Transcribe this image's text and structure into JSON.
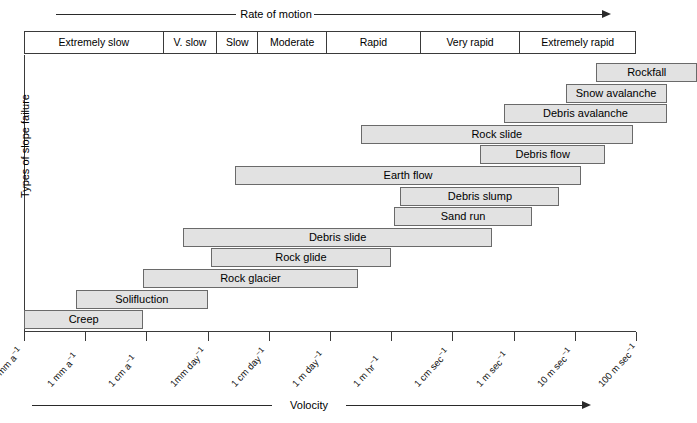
{
  "top_axis": {
    "label": "Rate of motion",
    "direction": "right"
  },
  "bottom_axis": {
    "label": "Volocity",
    "direction": "right"
  },
  "y_axis": {
    "label": "Types of slope failure"
  },
  "rate_classes": [
    {
      "label": "Extremely slow"
    },
    {
      "label": "V. slow"
    },
    {
      "label": "Slow"
    },
    {
      "label": "Moderate"
    },
    {
      "label": "Rapid"
    },
    {
      "label": "Very rapid"
    },
    {
      "label": "Extremely rapid"
    }
  ],
  "x_tick_labels": [
    "0.1 mm a",
    "1 mm a",
    "1 cm a",
    "1mm day",
    "1 cm day",
    "1 m day",
    "1 m hr",
    "1 cm sec",
    "1 m sec",
    "10 m sec",
    "100 m sec"
  ],
  "x_tick_exponent": "−1",
  "chart_data": {
    "type": "bar",
    "title": "",
    "subtitle": "",
    "xlabel": "Volocity",
    "ylabel": "Types of slope failure",
    "orientation": "horizontal-range",
    "grid": false,
    "legend": "none",
    "top_band_label": "Rate of motion",
    "x_axis_scale": "logarithmic velocity",
    "x_tick_labels": [
      "0.1 mm a⁻¹",
      "1 mm a⁻¹",
      "1 cm a⁻¹",
      "1mm day⁻¹",
      "1 cm day⁻¹",
      "1 m day⁻¹",
      "1 m hr⁻¹",
      "1 cm sec⁻¹",
      "1 m sec⁻¹",
      "10 m sec⁻¹",
      "100 m sec⁻¹"
    ],
    "rate_classes": [
      "Extremely slow",
      "V. slow",
      "Slow",
      "Moderate",
      "Rapid",
      "Very rapid",
      "Extremely rapid"
    ],
    "categories": [
      "Rockfall",
      "Snow avalanche",
      "Debris avalanche",
      "Rock slide",
      "Debris flow",
      "Earth flow",
      "Debris slump",
      "Sand run",
      "Debris slide",
      "Rock glide",
      "Rock glacier",
      "Solifluction",
      "Creep"
    ],
    "bars": [
      {
        "label": "Rockfall",
        "start_tick": 9.35,
        "end_tick": 11.0
      },
      {
        "label": "Snow avalanche",
        "start_tick": 8.85,
        "end_tick": 10.5
      },
      {
        "label": "Debris avalanche",
        "start_tick": 7.85,
        "end_tick": 10.5
      },
      {
        "label": "Rock slide",
        "start_tick": 5.5,
        "end_tick": 9.95
      },
      {
        "label": "Debris flow",
        "start_tick": 7.45,
        "end_tick": 9.5
      },
      {
        "label": "Earth flow",
        "start_tick": 3.45,
        "end_tick": 9.1
      },
      {
        "label": "Debris slump",
        "start_tick": 6.15,
        "end_tick": 8.75
      },
      {
        "label": "Sand run",
        "start_tick": 6.05,
        "end_tick": 8.3
      },
      {
        "label": "Debris slide",
        "start_tick": 2.6,
        "end_tick": 7.65
      },
      {
        "label": "Rock glide",
        "start_tick": 3.05,
        "end_tick": 6.0
      },
      {
        "label": "Rock glacier",
        "start_tick": 1.95,
        "end_tick": 5.45
      },
      {
        "label": "Solifluction",
        "start_tick": 0.85,
        "end_tick": 3.0
      },
      {
        "label": "Creep",
        "start_tick": 0.0,
        "end_tick": 1.95
      }
    ]
  }
}
